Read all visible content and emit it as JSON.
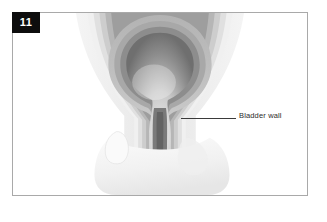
{
  "figure": {
    "number": "11",
    "frame_border_color": "#a9a9a9",
    "background_color": "#ffffff",
    "badge_background_color": "#0d0d0d",
    "badge_text_color": "#ffffff"
  },
  "annotations": [
    {
      "id": "bladder-wall",
      "label": "Bladder wall",
      "leader_color": "#3a3a3a",
      "text_color": "#2b2b2b"
    }
  ],
  "illustration": {
    "subject": "bladder-cross-section",
    "style": "grayscale-medical-diagram",
    "wall_layer_colors": [
      "#f2f2f2",
      "#dcdcdc",
      "#c6c6c6",
      "#ababab",
      "#8f8f8f",
      "#767676"
    ],
    "lumen_dark_color": "#6d6d6d",
    "lumen_light_color": "#e8e8e8",
    "surrounding_tissue_color": "#f4f4f4"
  }
}
